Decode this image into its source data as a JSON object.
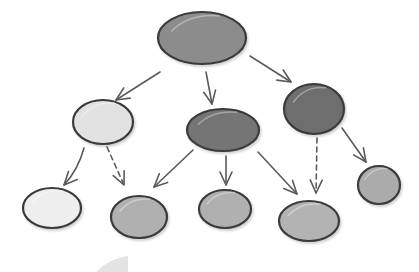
{
  "diagram": {
    "type": "tree",
    "style": "hand-drawn",
    "colors": {
      "background": "#ffffff",
      "outline": "#3a3a3a",
      "edge": "#5a5a5a",
      "dark": "#6b6b6b",
      "medium": "#a9a9a9",
      "light": "#e6e6e6"
    },
    "nodes": [
      {
        "id": "root",
        "shade": "medium-dark",
        "fill": "#8c8c8c",
        "cx": 202,
        "cy": 38,
        "rx": 44,
        "ry": 26
      },
      {
        "id": "l1-left",
        "shade": "light",
        "fill": "#e2e2e2",
        "cx": 103,
        "cy": 122,
        "rx": 30,
        "ry": 22
      },
      {
        "id": "l1-middle",
        "shade": "dark",
        "fill": "#757575",
        "cx": 223,
        "cy": 130,
        "rx": 36,
        "ry": 21
      },
      {
        "id": "l1-right",
        "shade": "dark",
        "fill": "#6e6e6e",
        "cx": 314,
        "cy": 109,
        "rx": 30,
        "ry": 25
      },
      {
        "id": "l2-1",
        "shade": "light",
        "fill": "#eeeeee",
        "cx": 52,
        "cy": 208,
        "rx": 29,
        "ry": 20
      },
      {
        "id": "l2-2",
        "shade": "medium",
        "fill": "#b0b0b0",
        "cx": 139,
        "cy": 217,
        "rx": 28,
        "ry": 21
      },
      {
        "id": "l2-3",
        "shade": "medium",
        "fill": "#b0b0b0",
        "cx": 225,
        "cy": 209,
        "rx": 26,
        "ry": 19
      },
      {
        "id": "l2-4",
        "shade": "medium",
        "fill": "#b3b3b3",
        "cx": 309,
        "cy": 221,
        "rx": 30,
        "ry": 20
      },
      {
        "id": "l2-5",
        "shade": "medium",
        "fill": "#ababab",
        "cx": 379,
        "cy": 185,
        "rx": 21,
        "ry": 19
      }
    ],
    "edges": [
      {
        "from": "root",
        "to": "l1-left",
        "style": "solid",
        "path": "M160,72 L116,100",
        "tip": [
          116,
          100
        ]
      },
      {
        "from": "root",
        "to": "l1-middle",
        "style": "solid",
        "path": "M206,72 L212,104",
        "tip": [
          212,
          104
        ]
      },
      {
        "from": "root",
        "to": "l1-right",
        "style": "solid",
        "path": "M250,56 L291,82",
        "tip": [
          291,
          82
        ]
      },
      {
        "from": "l1-left",
        "to": "l2-1",
        "style": "solid",
        "path": "M84,148 Q78,170 64,185",
        "tip": [
          64,
          185
        ]
      },
      {
        "from": "l1-left",
        "to": "l2-2",
        "style": "dashed",
        "path": "M107,147 L124,185",
        "tip": [
          124,
          185
        ]
      },
      {
        "from": "l1-middle",
        "to": "l2-2",
        "style": "solid",
        "path": "M193,150 L154,187",
        "tip": [
          154,
          187
        ]
      },
      {
        "from": "l1-middle",
        "to": "l2-3",
        "style": "solid",
        "path": "M226,156 L226,185",
        "tip": [
          226,
          185
        ]
      },
      {
        "from": "l1-middle",
        "to": "l2-4",
        "style": "solid",
        "path": "M258,152 L297,194",
        "tip": [
          297,
          194
        ]
      },
      {
        "from": "l1-right",
        "to": "l2-4",
        "style": "dashed",
        "path": "M317,138 L316,193",
        "tip": [
          316,
          193
        ]
      },
      {
        "from": "l1-right",
        "to": "l2-5",
        "style": "solid",
        "path": "M342,128 L366,162",
        "tip": [
          366,
          162
        ]
      }
    ]
  }
}
